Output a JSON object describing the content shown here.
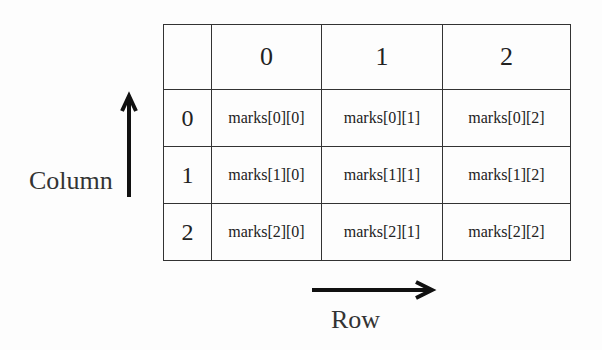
{
  "diagram": {
    "header": {
      "corner": "",
      "columns": [
        "0",
        "1",
        "2"
      ]
    },
    "rows": [
      {
        "index": "0",
        "cells": [
          "marks[0][0]",
          "marks[0][1]",
          "marks[0][2]"
        ]
      },
      {
        "index": "1",
        "cells": [
          "marks[1][0]",
          "marks[1][1]",
          "marks[1][2]"
        ]
      },
      {
        "index": "2",
        "cells": [
          "marks[2][0]",
          "marks[2][1]",
          "marks[2][2]"
        ]
      }
    ],
    "labels": {
      "vertical_axis": "Column",
      "horizontal_axis": "Row"
    },
    "colors": {
      "line": "#333333",
      "text": "#222222",
      "arrow": "#111111",
      "background": "#fdfdfd"
    }
  }
}
